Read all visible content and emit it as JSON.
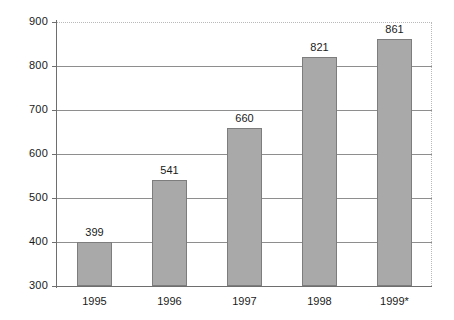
{
  "chart_data": {
    "type": "bar",
    "title": "",
    "xlabel": "",
    "ylabel": "",
    "categories": [
      "1995",
      "1996",
      "1997",
      "1998",
      "1999*"
    ],
    "values": [
      399,
      541,
      660,
      821,
      861
    ],
    "data_labels": [
      "399",
      "541",
      "660",
      "821",
      "861"
    ],
    "ylim": [
      300,
      900
    ],
    "y_ticks": [
      900,
      800,
      700,
      600,
      500,
      400,
      300
    ],
    "y_tick_labels": [
      "900",
      "800",
      "700",
      "600",
      "500",
      "400",
      "300"
    ],
    "grid": true,
    "grid_axis": "y",
    "legend": false,
    "legend_position": "none",
    "series": [
      {
        "name": "",
        "values": [
          399,
          541,
          660,
          821,
          861
        ]
      }
    ],
    "footnote_marker": "*",
    "colors": {
      "bar_fill": "#a9a9a9",
      "bar_stroke": "#7d7d7d",
      "gridline": "#8e8e8e",
      "axis": "#6e6e6e",
      "frame_dotted": "#b9b9b9",
      "text": "#1a1a1a",
      "background": "#ffffff"
    }
  }
}
